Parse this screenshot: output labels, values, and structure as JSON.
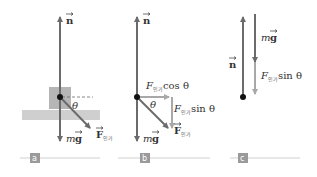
{
  "figure": {
    "panels": [
      {
        "id": "a",
        "tag": "a",
        "labels": {
          "normal": "n",
          "weight_m": "m",
          "weight_g": "g",
          "applied": "F",
          "applied_sub": "인가",
          "angle": "θ"
        }
      },
      {
        "id": "b",
        "tag": "b",
        "labels": {
          "normal": "n",
          "weight_m": "m",
          "weight_g": "g",
          "applied": "F",
          "applied_sub": "인가",
          "angle": "θ",
          "horiz_F": "F",
          "horiz_sub": "인가",
          "horiz_func": "cos θ",
          "vert_F": "F",
          "vert_sub": "인가",
          "vert_func": "sin θ"
        }
      },
      {
        "id": "c",
        "tag": "c",
        "labels": {
          "normal": "n",
          "weight_m": "m",
          "weight_g": "g",
          "vert_F": "F",
          "vert_sub": "인가",
          "vert_func": "sin θ"
        }
      }
    ],
    "colors": {
      "vector_dark": "#6b6b6b",
      "vector_light": "#a8a8a8",
      "block": "#b5b5b5",
      "ground": "#cfcfcf",
      "tag_bg": "#9a9a9a",
      "rule": "#d0d0d0",
      "dot": "#111111"
    }
  }
}
